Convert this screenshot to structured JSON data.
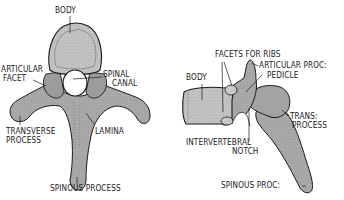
{
  "figure": {
    "colors": {
      "bone_fill": "#a8a8a8",
      "bone_light": "#c4c4c4",
      "bone_dark": "#8a8a8a",
      "outline": "#1a1a1a",
      "background": "#ffffff"
    },
    "superior_view": {
      "labels": {
        "body": "BODY",
        "articular_facet_line1": "ARTICULAR",
        "articular_facet_line2": "FACET",
        "spinal_canal_line1": "SPINAL",
        "spinal_canal_line2": "CANAL",
        "transverse_process_line1": "TRANSVERSE",
        "transverse_process_line2": "PROCESS",
        "lamina": "LAMINA",
        "spinous_process": "SPINOUS PROCESS"
      }
    },
    "lateral_view": {
      "labels": {
        "facets_for_ribs": "FACETS FOR RIBS",
        "body": "BODY",
        "articular_proc": "ARTICULAR PROC:",
        "pedicle": "PEDICLE",
        "trans_process_line1": "TRANS:",
        "trans_process_line2": "PROCESS",
        "intervertebral_notch_line1": "INTERVERTEBRAL",
        "intervertebral_notch_line2": "NOTCH",
        "spinous_proc": "SPINOUS PROC:"
      }
    }
  }
}
